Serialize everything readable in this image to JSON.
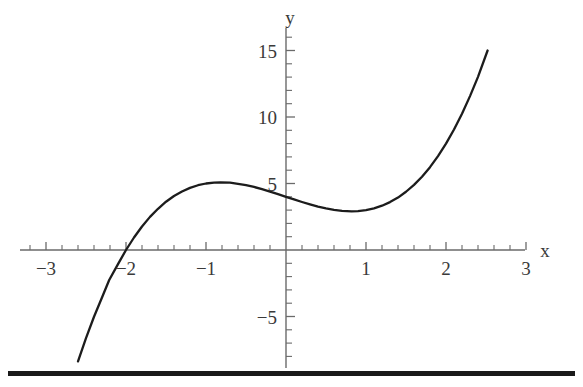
{
  "figure": {
    "background_color": "#ffffff",
    "curve_color": "#1c1c1c",
    "axis_color": "#6a6a6a",
    "rule_color": "#1a1a1a",
    "x_axis_label": "x",
    "y_axis_label": "y"
  },
  "chart_data": {
    "type": "line",
    "title": "",
    "xlabel": "x",
    "ylabel": "y",
    "xlim": [
      -3.2,
      3.2
    ],
    "ylim": [
      -8.5,
      16.5
    ],
    "grid": false,
    "legend": null,
    "axes_style": "cartesian-cross",
    "x_ticks_major": [
      -3,
      -2,
      -1,
      1,
      2,
      3
    ],
    "x_tick_labels": [
      "−3",
      "−2",
      "−1",
      "1",
      "2",
      "3"
    ],
    "x_minor_tick_step": 0.2,
    "y_ticks_major": [
      -5,
      5,
      10,
      15
    ],
    "y_tick_labels": [
      "−5",
      "5",
      "10",
      "15"
    ],
    "y_minor_tick_step": 1,
    "function": "y = x^3 - 2x + 4",
    "domain_drawn": [
      -2.6,
      2.52
    ],
    "features": {
      "local_maximum": {
        "x": -0.82,
        "y": 5.09
      },
      "local_minimum": {
        "x": 0.82,
        "y": 2.91
      },
      "x_intercept": {
        "x": -2.21,
        "y": 0
      },
      "y_intercept": {
        "x": 0,
        "y": 4
      }
    },
    "series": [
      {
        "name": "y = x^3 - 2x + 4",
        "x": [
          -2.6,
          -2.5,
          -2.4,
          -2.3,
          -2.21,
          -2.1,
          -2.0,
          -1.9,
          -1.8,
          -1.7,
          -1.6,
          -1.5,
          -1.4,
          -1.3,
          -1.2,
          -1.1,
          -1.0,
          -0.9,
          -0.82,
          -0.7,
          -0.6,
          -0.5,
          -0.4,
          -0.3,
          -0.2,
          -0.1,
          0.0,
          0.1,
          0.2,
          0.3,
          0.4,
          0.5,
          0.6,
          0.7,
          0.82,
          0.9,
          1.0,
          1.1,
          1.2,
          1.3,
          1.4,
          1.5,
          1.6,
          1.7,
          1.8,
          1.9,
          2.0,
          2.1,
          2.2,
          2.3,
          2.4,
          2.52
        ],
        "y": [
          -8.38,
          -6.63,
          -5.02,
          -3.57,
          -2.26,
          -1.06,
          0.0,
          0.94,
          1.77,
          2.49,
          3.1,
          3.63,
          4.06,
          4.4,
          4.67,
          4.87,
          5.0,
          5.07,
          5.09,
          5.06,
          4.98,
          4.88,
          4.74,
          4.57,
          4.39,
          4.2,
          4.0,
          3.8,
          3.61,
          3.43,
          3.26,
          3.13,
          3.02,
          2.94,
          2.91,
          2.93,
          3.0,
          3.13,
          3.33,
          3.6,
          3.94,
          4.38,
          4.9,
          5.51,
          6.23,
          7.06,
          8.0,
          9.06,
          10.25,
          11.57,
          13.02,
          15.0
        ]
      }
    ]
  }
}
